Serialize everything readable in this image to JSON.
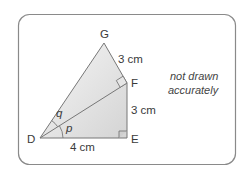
{
  "diagram": {
    "vertices": {
      "D": {
        "label": "D",
        "x": 40,
        "y": 138
      },
      "E": {
        "label": "E",
        "x": 127,
        "y": 138
      },
      "F": {
        "label": "F",
        "x": 127,
        "y": 83
      },
      "G": {
        "label": "G",
        "x": 104,
        "y": 43
      }
    },
    "edges": [
      {
        "from": "D",
        "to": "E",
        "length_label": "4 cm"
      },
      {
        "from": "E",
        "to": "F",
        "length_label": "3 cm"
      },
      {
        "from": "F",
        "to": "G",
        "length_label": "3 cm"
      },
      {
        "from": "D",
        "to": "F",
        "length_label": ""
      },
      {
        "from": "D",
        "to": "G",
        "length_label": ""
      }
    ],
    "right_angles": [
      "E",
      "F"
    ],
    "angles": [
      {
        "label": "p",
        "at": "D",
        "between": [
          "E",
          "F"
        ]
      },
      {
        "label": "q",
        "at": "D",
        "between": [
          "F",
          "G"
        ]
      }
    ],
    "labels": {
      "G": "G",
      "F": "F",
      "E": "E",
      "D": "D",
      "GF_length": "3 cm",
      "FE_length": "3 cm",
      "DE_length": "4 cm",
      "angle_p": "p",
      "angle_q": "q"
    },
    "note": {
      "line1": "not drawn",
      "line2": "accurately"
    },
    "colors": {
      "stroke": "#777777",
      "frame": "#8a8a8a",
      "fill_light": "#f4f4f4",
      "fill_dark": "#d6d6d6"
    }
  }
}
